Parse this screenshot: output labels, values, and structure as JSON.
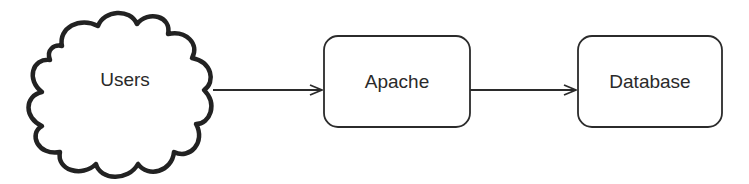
{
  "diagram": {
    "type": "flow",
    "colors": {
      "stroke": "#2b2b2b",
      "background": "#ffffff",
      "text": "#2a2a2a"
    },
    "nodes": [
      {
        "id": "users",
        "label": "Users",
        "shape": "cloud"
      },
      {
        "id": "apache",
        "label": "Apache",
        "shape": "rounded-rect"
      },
      {
        "id": "database",
        "label": "Database",
        "shape": "rounded-rect"
      }
    ],
    "edges": [
      {
        "from": "users",
        "to": "apache"
      },
      {
        "from": "apache",
        "to": "database"
      }
    ]
  }
}
